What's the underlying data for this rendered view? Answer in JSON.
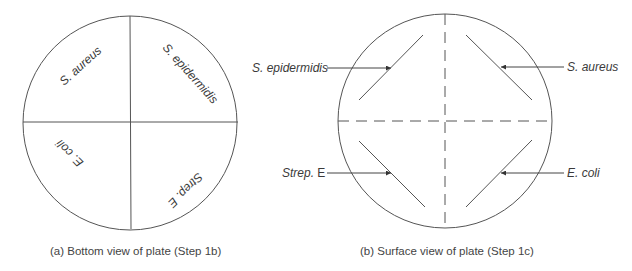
{
  "figure": {
    "panel_a": {
      "caption": "(a) Bottom view of plate (Step 1b)",
      "quadrants": {
        "top_left": "S. aureus",
        "top_right": "S. epidermidis",
        "bottom_left": "E. coli",
        "bottom_right": "Strep. E"
      }
    },
    "panel_b": {
      "caption": "(b) Surface view of plate (Step 1c)",
      "labels": {
        "top_left": "S. epidermidis",
        "top_right": "S. aureus",
        "bottom_left_italic": "Strep.",
        "bottom_left_plain": " E",
        "bottom_right": "E. coli"
      }
    },
    "colors": {
      "line": "#555555",
      "text": "#3a3a3a"
    }
  }
}
